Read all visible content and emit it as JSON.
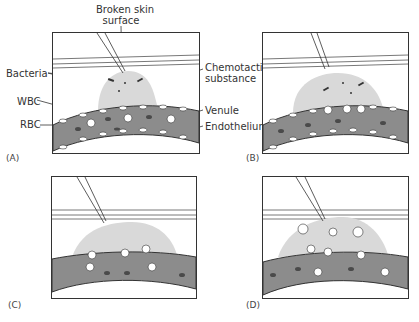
{
  "figure": {
    "labels": {
      "broken_skin_line1": "Broken skin",
      "broken_skin_line2": "surface",
      "bacteria": "Bacteria",
      "chemotactic_line1": "Chemotactic",
      "chemotactic_line2": "substance",
      "wbc": "WBC",
      "rbc": "RBC",
      "venule": "Venule",
      "endothelium": "Endothelium"
    },
    "panels": [
      {
        "id": "A",
        "label": "(A)"
      },
      {
        "id": "B",
        "label": "(B)"
      },
      {
        "id": "C",
        "label": "(C)"
      },
      {
        "id": "D",
        "label": "(D)"
      }
    ],
    "colors": {
      "outline": "#333333",
      "venule_fill": "#8c8c8c",
      "infection_fill": "#d9d9d9",
      "rbc_fill": "#4a4a4a",
      "wbc_fill": "#ffffff"
    }
  }
}
